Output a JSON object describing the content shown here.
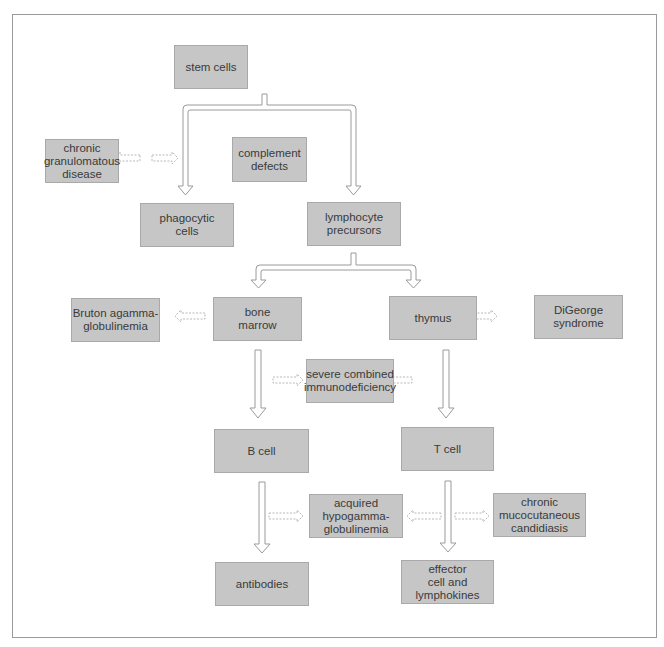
{
  "diagram": {
    "title": "",
    "nodes": {
      "stem_cells": "stem cells",
      "chronic_granulomatous_disease": "chronic\ngranulomatous\ndisease",
      "complement_defects": "complement\ndefects",
      "phagocytic_cells": "phagocytic\ncells",
      "lymphocyte_precursors": "lymphocyte\nprecursors",
      "bruton_agammaglobulinemia": "Bruton agamma-\nglobulinemia",
      "bone_marrow": "bone\nmarrow",
      "thymus": "thymus",
      "digeorge_syndrome": "DiGeorge\nsyndrome",
      "severe_combined_immunodeficiency": "severe combined\nimmunodeficiency",
      "b_cell": "B cell",
      "t_cell": "T cell",
      "acquired_hypogammaglobulinemia": "acquired\nhypogamma-\nglobulinemia",
      "chronic_mucocutaneous_candidiasis": "chronic\nmucocutaneous\ncandidiasis",
      "antibodies": "antibodies",
      "effector_cell_and_lymphokines": "effector\ncell and\nlymphokines"
    },
    "edges": [
      {
        "from": "stem_cells",
        "to": "phagocytic_cells",
        "style": "solid"
      },
      {
        "from": "stem_cells",
        "to": "lymphocyte_precursors",
        "style": "solid"
      },
      {
        "from": "lymphocyte_precursors",
        "to": "bone_marrow",
        "style": "solid"
      },
      {
        "from": "lymphocyte_precursors",
        "to": "thymus",
        "style": "solid"
      },
      {
        "from": "bone_marrow",
        "to": "b_cell",
        "style": "solid"
      },
      {
        "from": "thymus",
        "to": "t_cell",
        "style": "solid"
      },
      {
        "from": "b_cell",
        "to": "antibodies",
        "style": "solid"
      },
      {
        "from": "t_cell",
        "to": "effector_cell_and_lymphokines",
        "style": "solid"
      },
      {
        "from": "chronic_granulomatous_disease",
        "to": "phagocytic_cells",
        "style": "dashed"
      },
      {
        "from": "complement_defects",
        "to": "phagocytic_cells",
        "style": "dashed"
      },
      {
        "from": "bruton_agammaglobulinemia",
        "to": "bone_marrow",
        "style": "dashed"
      },
      {
        "from": "digeorge_syndrome",
        "to": "thymus",
        "style": "dashed"
      },
      {
        "from": "severe_combined_immunodeficiency",
        "to": "bone_marrow",
        "style": "dashed"
      },
      {
        "from": "severe_combined_immunodeficiency",
        "to": "thymus",
        "style": "dashed"
      },
      {
        "from": "acquired_hypogammaglobulinemia",
        "to": "b_cell",
        "style": "dashed"
      },
      {
        "from": "acquired_hypogammaglobulinemia",
        "to": "t_cell",
        "style": "dashed"
      },
      {
        "from": "chronic_mucocutaneous_candidiasis",
        "to": "t_cell",
        "style": "dashed"
      }
    ],
    "colors": {
      "box_fill": "#c6c6c6",
      "box_border": "#a9a9a9",
      "arrow_outline": "#9a9a9a",
      "dashed_arrow": "#b8b8b8",
      "text": "#3a3a3a"
    }
  }
}
